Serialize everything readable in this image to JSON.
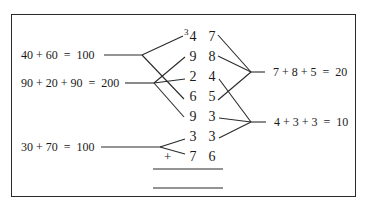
{
  "addition": {
    "carry": "3",
    "operator": "+",
    "rows": [
      {
        "tens": "4",
        "units": "7"
      },
      {
        "tens": "9",
        "units": "8"
      },
      {
        "tens": "2",
        "units": "4"
      },
      {
        "tens": "6",
        "units": "5"
      },
      {
        "tens": "9",
        "units": "3"
      },
      {
        "tens": "3",
        "units": "3"
      },
      {
        "tens": "7",
        "units": "6"
      }
    ]
  },
  "left_groups": [
    {
      "label": "40 + 60  =  100",
      "connects_tens_rows": [
        0,
        3
      ]
    },
    {
      "label": "90 + 20 + 90  =  200",
      "connects_tens_rows": [
        1,
        2,
        4
      ]
    },
    {
      "label": "30 + 70  =  100",
      "connects_tens_rows": [
        5,
        6
      ]
    }
  ],
  "right_groups": [
    {
      "label": "7 + 8 + 5  =  20",
      "connects_units_rows": [
        0,
        1,
        3
      ]
    },
    {
      "label": "4 + 3 + 3  =  10",
      "connects_units_rows": [
        2,
        4,
        5
      ]
    }
  ]
}
